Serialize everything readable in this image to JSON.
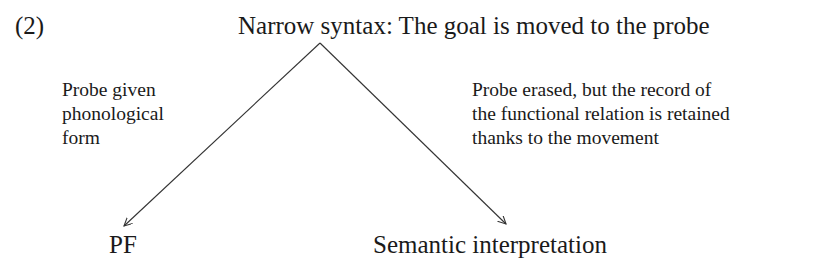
{
  "example_number": "(2)",
  "root": {
    "label": "Narrow syntax: The goal is moved to the probe"
  },
  "branches": [
    {
      "annotation": [
        "Probe given",
        "phonological",
        "form"
      ],
      "target": "PF"
    },
    {
      "annotation": [
        "Probe erased, but the record of",
        "the functional relation is retained",
        "thanks to the movement"
      ],
      "target": "Semantic interpretation"
    }
  ],
  "style": {
    "text_color": "#1a1a1a",
    "line_color": "#333333"
  }
}
